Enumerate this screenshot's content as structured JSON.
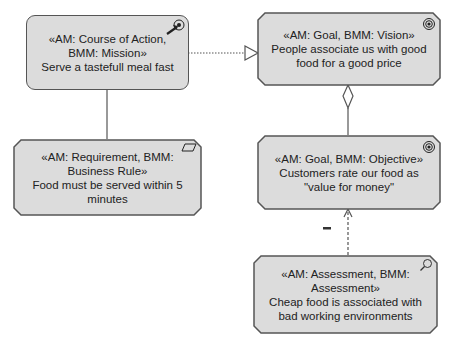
{
  "nodes": {
    "mission": {
      "stereotype": "«AM: Course of Action, BMM: Mission»",
      "name": "Serve a tastefull meal fast",
      "icon": "course-of-action-icon"
    },
    "vision": {
      "stereotype": "«AM: Goal, BMM: Vision»",
      "name": "People associate us with good food for a good price",
      "icon": "goal-target-icon"
    },
    "business_rule": {
      "stereotype": "«AM: Requirement, BMM: Business Rule»",
      "name": "Food must be served within 5 minutes",
      "icon": "requirement-icon"
    },
    "objective": {
      "stereotype": "«AM: Goal, BMM: Objective»",
      "name": "Customers rate our food as \"value for money\"",
      "icon": "goal-target-icon"
    },
    "assessment": {
      "stereotype": "«AM: Assessment, BMM: Assessment»",
      "name": "Cheap food is associated with bad working environments",
      "icon": "assessment-magnifier-icon"
    }
  },
  "edges": {
    "influence_label": "–"
  },
  "colors": {
    "fill": "#dcdcdc",
    "stroke": "#555555"
  }
}
